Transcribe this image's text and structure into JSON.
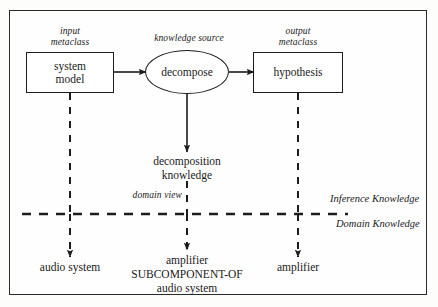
{
  "diagram": {
    "colors": {
      "line": "#1c1c1c",
      "frame": "#2a2a2a",
      "background": "#fefefe"
    },
    "nodes": {
      "input_box": {
        "label": "system\nmodel",
        "line1": "system",
        "line2": "model"
      },
      "knowledge_source": {
        "label": "decompose"
      },
      "output_box": {
        "label": "hypothesis"
      }
    },
    "captions": {
      "input_metaclass": {
        "line1": "input",
        "line2": "metaclass"
      },
      "knowledge_source": {
        "line1": "knowledge source"
      },
      "output_metaclass": {
        "line1": "output",
        "line2": "metaclass"
      },
      "domain_view": {
        "text": "domain view"
      }
    },
    "middle_label": {
      "line1": "decomposition",
      "line2": "knowledge"
    },
    "layer_labels": {
      "upper": "Inference Knowledge",
      "lower": "Domain Knowledge"
    },
    "instances": {
      "left": {
        "line1": "audio system"
      },
      "center": {
        "line1": "amplifier",
        "line2": "SUBCOMPONENT-OF",
        "line3": "audio system"
      },
      "right": {
        "line1": "amplifier"
      }
    }
  }
}
